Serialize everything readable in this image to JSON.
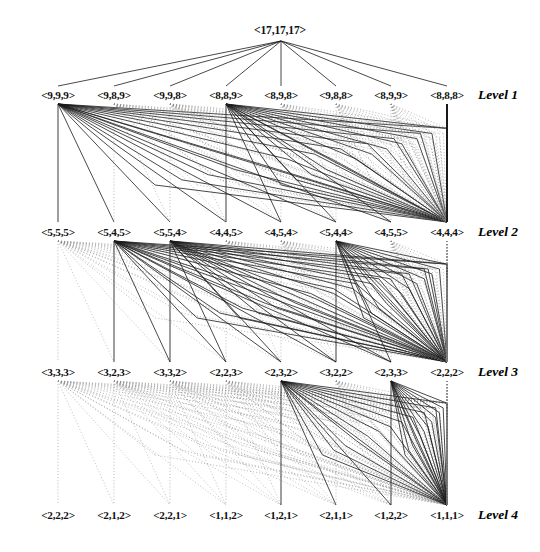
{
  "figure": {
    "root_label": "<17,17,17>",
    "root": {
      "x": 280,
      "y": 30,
      "apex_x": 281,
      "apex_y": 41
    },
    "colors": {
      "solid_edge": "#1a1a1a",
      "dotted_edge": "#8a8a8a",
      "text": "#111111",
      "background": "#ffffff"
    },
    "node_centers_x": [
      58,
      114,
      170,
      226,
      281,
      336,
      391,
      447
    ],
    "level_label_x": 478,
    "caption_text": ""
  },
  "levels": [
    {
      "name": "Level 1",
      "label_y": 95,
      "node_y": 95,
      "fan_y": 185,
      "nodes": [
        {
          "label": "<9,9,9>",
          "style": "solid"
        },
        {
          "label": "<9,8,9>",
          "style": "dotted"
        },
        {
          "label": "<9,9,8>",
          "style": "dotted"
        },
        {
          "label": "<8,8,9>",
          "style": "solid"
        },
        {
          "label": "<8,9,8>",
          "style": "dotted"
        },
        {
          "label": "<9,8,8>",
          "style": "dotted"
        },
        {
          "label": "<8,9,9>",
          "style": "dotted"
        },
        {
          "label": "<8,8,8>",
          "style": "solid"
        }
      ]
    },
    {
      "name": "Level 2",
      "label_y": 232,
      "node_y": 232,
      "fan_y": 318,
      "nodes": [
        {
          "label": "<5,5,5>",
          "style": "dotted"
        },
        {
          "label": "<5,4,5>",
          "style": "solid"
        },
        {
          "label": "<5,5,4>",
          "style": "solid"
        },
        {
          "label": "<4,4,5>",
          "style": "dotted"
        },
        {
          "label": "<4,5,4>",
          "style": "dotted"
        },
        {
          "label": "<5,4,4>",
          "style": "solid"
        },
        {
          "label": "<4,5,5>",
          "style": "dotted"
        },
        {
          "label": "<4,4,4>",
          "style": "dotted"
        }
      ]
    },
    {
      "name": "Level 3",
      "label_y": 372,
      "node_y": 372,
      "fan_y": 455,
      "nodes": [
        {
          "label": "<3,3,3>",
          "style": "dotted"
        },
        {
          "label": "<3,2,3>",
          "style": "dotted"
        },
        {
          "label": "<3,3,2>",
          "style": "dotted"
        },
        {
          "label": "<2,2,3>",
          "style": "dotted"
        },
        {
          "label": "<2,3,2>",
          "style": "solid"
        },
        {
          "label": "<3,2,2>",
          "style": "dotted"
        },
        {
          "label": "<2,3,3>",
          "style": "solid"
        },
        {
          "label": "<2,2,2>",
          "style": "dotted"
        }
      ]
    },
    {
      "name": "Level 4",
      "label_y": 515,
      "node_y": 515,
      "fan_y": 0,
      "nodes": [
        {
          "label": "<2,2,2>",
          "style": "none"
        },
        {
          "label": "<2,1,2>",
          "style": "none"
        },
        {
          "label": "<2,2,1>",
          "style": "none"
        },
        {
          "label": "<1,1,2>",
          "style": "none"
        },
        {
          "label": "<1,2,1>",
          "style": "none"
        },
        {
          "label": "<2,1,1>",
          "style": "none"
        },
        {
          "label": "<1,2,2>",
          "style": "none"
        },
        {
          "label": "<1,1,1>",
          "style": "none"
        }
      ]
    }
  ],
  "edges": {
    "root_to_level1_count": 8,
    "inter_level_pairs": [
      {
        "from_level": 1,
        "to_level": 2
      },
      {
        "from_level": 2,
        "to_level": 3
      },
      {
        "from_level": 3,
        "to_level": 4
      }
    ]
  }
}
